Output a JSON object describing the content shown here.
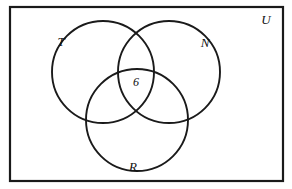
{
  "figure": {
    "type": "venn-diagram-3-set",
    "background_color": "#ffffff",
    "stroke_color": "#1a1a1a",
    "universe": {
      "label": "U",
      "label_x": 266,
      "label_y": 24,
      "rect": {
        "x": 10,
        "y": 7,
        "width": 273,
        "height": 174
      }
    },
    "sets": [
      {
        "key": "T",
        "label": "T",
        "cx": 103,
        "cy": 72,
        "r": 51,
        "label_x": 61,
        "label_y": 46
      },
      {
        "key": "N",
        "label": "N",
        "cx": 169,
        "cy": 72,
        "r": 51,
        "label_x": 205,
        "label_y": 47
      },
      {
        "key": "R",
        "label": "R",
        "cx": 137,
        "cy": 120,
        "r": 51,
        "label_x": 133,
        "label_y": 171
      }
    ],
    "region_labels": [
      {
        "region": "T-and-N-and-R",
        "value": "6",
        "x": 136,
        "y": 86
      }
    ]
  },
  "chart_data": {
    "type": "venn",
    "title": "",
    "sets": [
      "T",
      "N",
      "R"
    ],
    "universe_label": "U",
    "regions": [
      {
        "region": "T∩N∩R",
        "label": "6",
        "value": 6
      },
      {
        "region": "T only",
        "label": "",
        "value": null
      },
      {
        "region": "N only",
        "label": "",
        "value": null
      },
      {
        "region": "R only",
        "label": "",
        "value": null
      },
      {
        "region": "T∩N only",
        "label": "",
        "value": null
      },
      {
        "region": "T∩R only",
        "label": "",
        "value": null
      },
      {
        "region": "N∩R only",
        "label": "",
        "value": null
      },
      {
        "region": "outside (U only)",
        "label": "",
        "value": null
      }
    ]
  }
}
